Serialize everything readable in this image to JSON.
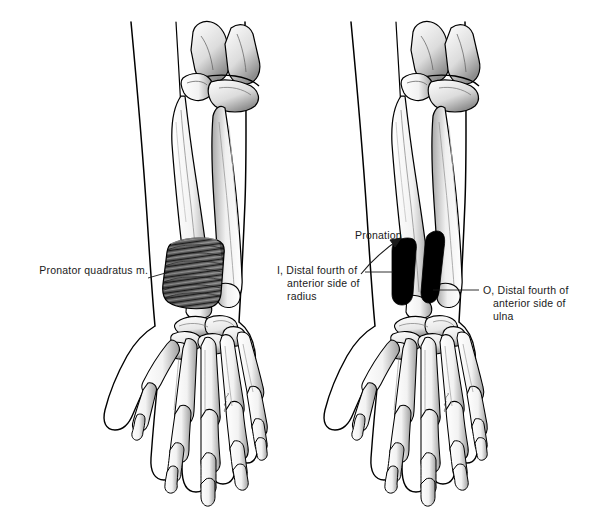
{
  "figure": {
    "panels": [
      {
        "id": "left-panel",
        "name": "pronator-quadratus-muscle-view",
        "description": "Anterior view of right forearm and hand with pronator quadratus muscle shown in place between distal radius and ulna"
      },
      {
        "id": "right-panel",
        "name": "pronator-quadratus-attachments-view",
        "description": "Anterior view of right forearm and hand showing origin and insertion attachment areas of pronator quadratus in black, with pronation motion arrow"
      }
    ],
    "labels": {
      "muscle_name": "Pronator quadratus m.",
      "action": "Pronation",
      "insertion": "I, Distal fourth of\nanterior side of\nradius",
      "insertion_lines": [
        "I, Distal fourth of",
        "anterior side of",
        "radius"
      ],
      "origin": "O, Distal fourth of\nanterior side of\nulna",
      "origin_lines": [
        "O, Distal fourth of",
        "anterior side of",
        "ulna"
      ]
    },
    "signature": "artist-signature",
    "colors": {
      "ink": "#1a1a1a",
      "line": "#000000",
      "bone_fill": "#ffffff",
      "bone_shade": "#b9b9b9",
      "muscle_dark": "#3a3a3a",
      "attachment_black": "#000000",
      "background": "#ffffff"
    }
  }
}
